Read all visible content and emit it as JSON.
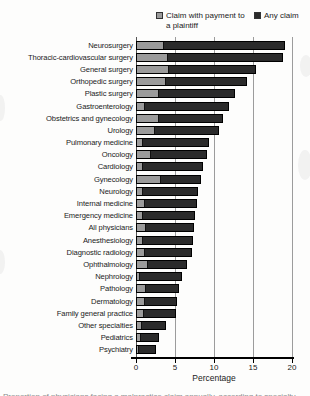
{
  "legend": [
    {
      "label": "Claim with payment to a plaintiff",
      "color": "#9b9b9b"
    },
    {
      "label": "Any claim",
      "color": "#2b2b2b"
    }
  ],
  "axis": {
    "xlabel": "Percentage",
    "xticks": [
      0,
      5,
      10,
      15,
      20
    ]
  },
  "caption_fragment": "Proportion of physicians facing a malpractice claim annually, according to specialty",
  "chart_data": {
    "type": "bar",
    "orientation": "horizontal",
    "title": "",
    "xlabel": "Percentage",
    "xlim": [
      0,
      20
    ],
    "xticks": [
      0,
      5,
      10,
      15,
      20
    ],
    "grid": "vertical-gridlines-at-5-10-15-20",
    "legend_position": "top",
    "categories": [
      "Neurosurgery",
      "Thoracic-cardiovascular surgery",
      "General surgery",
      "Orthopedic surgery",
      "Plastic surgery",
      "Gastroenterology",
      "Obstetrics and gynecology",
      "Urology",
      "Pulmonary medicine",
      "Oncology",
      "Cardiology",
      "Gynecology",
      "Neurology",
      "Internal medicine",
      "Emergency medicine",
      "All physicians",
      "Anesthesiology",
      "Diagnostic radiology",
      "Ophthalmology",
      "Nephrology",
      "Pathology",
      "Dermatology",
      "Family general practice",
      "Other specialties",
      "Pediatrics",
      "Psychiatry"
    ],
    "series": [
      {
        "name": "Any claim",
        "color": "#2b2b2b",
        "values": [
          19.1,
          18.9,
          15.4,
          14.2,
          12.7,
          11.9,
          11.1,
          10.6,
          9.4,
          9.1,
          8.6,
          8.3,
          8.0,
          7.8,
          7.6,
          7.4,
          7.3,
          7.2,
          6.6,
          5.9,
          5.5,
          5.3,
          5.1,
          3.9,
          3.0,
          2.6
        ]
      },
      {
        "name": "Claim with payment to a plaintiff",
        "color": "#9b9b9b",
        "values": [
          3.4,
          3.9,
          4.0,
          3.6,
          2.8,
          0.9,
          2.7,
          2.2,
          0.7,
          1.7,
          0.6,
          3.0,
          0.7,
          0.9,
          0.7,
          1.0,
          0.7,
          0.9,
          1.3,
          0.3,
          1.1,
          1.0,
          0.8,
          0.6,
          0.4,
          0.2
        ]
      }
    ]
  }
}
